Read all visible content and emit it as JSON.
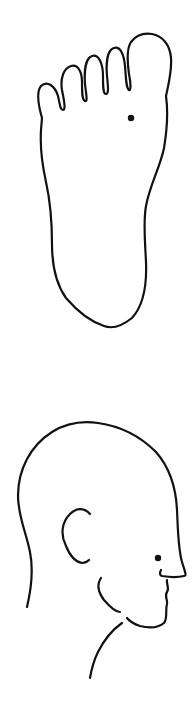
{
  "figure": {
    "panels": [
      {
        "id": "foot",
        "subject": "sole of foot (plantar view)",
        "point_marker": {
          "shape": "dot",
          "color": "#111111",
          "x": 131,
          "y": 118
        }
      },
      {
        "id": "head",
        "subject": "head in right-facing profile",
        "point_marker": {
          "shape": "dot",
          "color": "#111111",
          "x": 158,
          "y": 558
        }
      }
    ],
    "line_color": "#111111",
    "background_color": "#ffffff"
  }
}
